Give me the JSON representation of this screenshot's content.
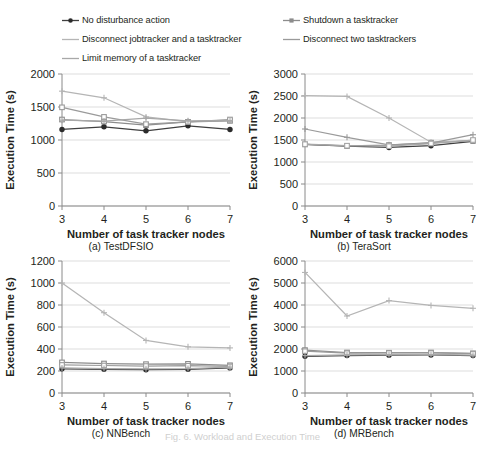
{
  "legend": {
    "items": [
      {
        "label": "No disturbance action",
        "marker": "filled-circle-marker",
        "color": "#3f3f3f",
        "column": "left"
      },
      {
        "label": "Shutdown a tasktracker",
        "marker": "small-square-marker",
        "color": "#8c8c8c",
        "column": "right"
      },
      {
        "label": "Disconnect jobtracker and a tasktracker",
        "marker": "line-marker",
        "color": "#b5b5b5",
        "column": "left"
      },
      {
        "label": "Disconnect two tasktrackers",
        "marker": "line-marker",
        "color": "#9a9a9a",
        "column": "right"
      },
      {
        "label": "Limit memory of a tasktracker",
        "marker": "line-marker",
        "color": "#a8a8a8",
        "column": "left"
      }
    ]
  },
  "panels": [
    {
      "key": "a",
      "caption": "(a) TestDFSIO"
    },
    {
      "key": "b",
      "caption": "(b) TeraSort"
    },
    {
      "key": "c",
      "caption": "(c) NNBench"
    },
    {
      "key": "d",
      "caption": "(d) MRBench"
    }
  ],
  "figure_caption": "Fig. 6. Workload and Execution Time",
  "chart_data": [
    {
      "id": "a",
      "type": "line",
      "title": "(a) TestDFSIO",
      "xlabel": "Number of task tracker nodes",
      "ylabel": "Execution Time (s)",
      "x": [
        3,
        4,
        5,
        6,
        7
      ],
      "xticks": [
        "3",
        "4",
        "5",
        "6",
        "7"
      ],
      "yticks": [
        0,
        500,
        1000,
        1500,
        2000
      ],
      "ylim": [
        0,
        2000
      ],
      "grid": true,
      "legend_position": "above-figure",
      "series": [
        {
          "name": "No disturbance action",
          "values": [
            1160,
            1200,
            1140,
            1215,
            1160
          ],
          "color": "#3f3f3f",
          "marker": "filled-circle"
        },
        {
          "name": "Shutdown a tasktracker",
          "values": [
            1310,
            1280,
            1225,
            1275,
            1290
          ],
          "color": "#8c8c8c",
          "marker": "square"
        },
        {
          "name": "Disconnect jobtracker and a tasktracker",
          "values": [
            1740,
            1640,
            1350,
            1280,
            1300
          ],
          "color": "#b5b5b5",
          "marker": "plus"
        },
        {
          "name": "Disconnect two tasktrackers",
          "values": [
            1495,
            1350,
            1240,
            1275,
            1310
          ],
          "color": "#9a9a9a",
          "marker": "square"
        },
        {
          "name": "Limit memory of a tasktracker",
          "values": [
            1300,
            1285,
            1330,
            1290,
            1295
          ],
          "color": "#a8a8a8",
          "marker": "plus"
        }
      ]
    },
    {
      "id": "b",
      "type": "line",
      "title": "(b) TeraSort",
      "xlabel": "Number of task tracker nodes",
      "ylabel": "Execution Time (s)",
      "x": [
        3,
        4,
        5,
        6,
        7
      ],
      "xticks": [
        "3",
        "4",
        "5",
        "6",
        "7"
      ],
      "yticks": [
        0,
        500,
        1000,
        1500,
        2000,
        2500,
        3000
      ],
      "ylim": [
        0,
        3000
      ],
      "grid": true,
      "legend_position": "above-figure",
      "series": [
        {
          "name": "No disturbance action",
          "values": [
            1400,
            1360,
            1330,
            1370,
            1470
          ],
          "color": "#3f3f3f",
          "marker": "filled-circle"
        },
        {
          "name": "Shutdown a tasktracker",
          "values": [
            1400,
            1365,
            1385,
            1440,
            1480
          ],
          "color": "#8c8c8c",
          "marker": "square"
        },
        {
          "name": "Disconnect jobtracker and a tasktracker",
          "values": [
            2510,
            2490,
            2000,
            1450,
            1490
          ],
          "color": "#b5b5b5",
          "marker": "plus"
        },
        {
          "name": "Disconnect two tasktrackers",
          "values": [
            1750,
            1560,
            1390,
            1430,
            1620
          ],
          "color": "#9a9a9a",
          "marker": "plus"
        },
        {
          "name": "Limit memory of a tasktracker",
          "values": [
            1405,
            1370,
            1360,
            1420,
            1500
          ],
          "color": "#a8a8a8",
          "marker": "square"
        }
      ]
    },
    {
      "id": "c",
      "type": "line",
      "title": "(c) NNBench",
      "xlabel": "Number of task tracker nodes",
      "ylabel": "Execution Time (s)",
      "x": [
        3,
        4,
        5,
        6,
        7
      ],
      "xticks": [
        "3",
        "4",
        "5",
        "6",
        "7"
      ],
      "yticks": [
        0,
        200,
        400,
        600,
        800,
        1000,
        1200
      ],
      "ylim": [
        0,
        1200
      ],
      "grid": true,
      "legend_position": "above-figure",
      "series": [
        {
          "name": "No disturbance action",
          "values": [
            220,
            215,
            212,
            215,
            228
          ],
          "color": "#3f3f3f",
          "marker": "filled-circle"
        },
        {
          "name": "Shutdown a tasktracker",
          "values": [
            278,
            268,
            262,
            265,
            252
          ],
          "color": "#8c8c8c",
          "marker": "square"
        },
        {
          "name": "Disconnect jobtracker and a tasktracker",
          "values": [
            1000,
            730,
            478,
            420,
            410
          ],
          "color": "#b5b5b5",
          "marker": "plus"
        },
        {
          "name": "Disconnect two tasktrackers",
          "values": [
            255,
            250,
            245,
            248,
            242
          ],
          "color": "#9a9a9a",
          "marker": "square"
        },
        {
          "name": "Limit memory of a tasktracker",
          "values": [
            228,
            222,
            220,
            222,
            235
          ],
          "color": "#a8a8a8",
          "marker": "plus"
        }
      ]
    },
    {
      "id": "d",
      "type": "line",
      "title": "(d) MRBench",
      "xlabel": "Number of task tracker nodes",
      "ylabel": "Execution Time (s)",
      "x": [
        3,
        4,
        5,
        6,
        7
      ],
      "xticks": [
        "3",
        "4",
        "5",
        "6",
        "7"
      ],
      "yticks": [
        0,
        1000,
        2000,
        3000,
        4000,
        5000,
        6000
      ],
      "ylim": [
        0,
        6000
      ],
      "grid": true,
      "legend_position": "above-figure",
      "series": [
        {
          "name": "No disturbance action",
          "values": [
            1670,
            1700,
            1720,
            1730,
            1700
          ],
          "color": "#3f3f3f",
          "marker": "filled-circle"
        },
        {
          "name": "Shutdown a tasktracker",
          "values": [
            1950,
            1840,
            1830,
            1840,
            1800
          ],
          "color": "#8c8c8c",
          "marker": "square"
        },
        {
          "name": "Disconnect jobtracker and a tasktracker",
          "values": [
            5480,
            3500,
            4200,
            3980,
            3850
          ],
          "color": "#b5b5b5",
          "marker": "plus"
        },
        {
          "name": "Disconnect two tasktrackers",
          "values": [
            1900,
            1810,
            1820,
            1820,
            1790
          ],
          "color": "#9a9a9a",
          "marker": "square"
        },
        {
          "name": "Limit memory of a tasktracker",
          "values": [
            1700,
            1730,
            1745,
            1750,
            1720
          ],
          "color": "#a8a8a8",
          "marker": "plus"
        }
      ]
    }
  ]
}
